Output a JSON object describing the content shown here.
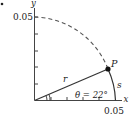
{
  "figure": {
    "marker": ".",
    "axes": {
      "x_label": "x",
      "y_label": "y",
      "x_max_label": "0.05",
      "y_max_label": "0.05",
      "y_ticks": 5,
      "x_ticks": 5
    },
    "arc": {
      "style": "dashed-then-solid",
      "radius_label": "0.05"
    },
    "radius_label": "r",
    "point_label": "P",
    "arc_length_label": "s",
    "angle_label": "θ = 22°",
    "angle_degrees": 22
  },
  "colors": {
    "ink": "#222222",
    "background": "#ffffff"
  }
}
